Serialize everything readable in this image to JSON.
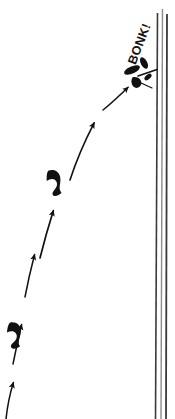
{
  "illustration": {
    "title": "Bird flying into window",
    "background_color": "#ffffff",
    "ink_color": "#111111",
    "pane_color": "#3a3a3a",
    "pane_highlight_color": "#8c8c8c",
    "canvas": {
      "width": 175,
      "height": 419
    }
  },
  "impact": {
    "label": "BONK!",
    "rotation_degrees": -69,
    "x": 140,
    "y": 44
  },
  "window_pane": {
    "name": "glass-pane",
    "line_count": 3,
    "lines": [
      {
        "x_top": 157.5,
        "y_top": 13,
        "x_bottom": 155.5,
        "y_bottom": 419,
        "width": 1.6,
        "tone": "dark"
      },
      {
        "x_top": 162.5,
        "y_top": 9,
        "x_bottom": 161.0,
        "y_bottom": 419,
        "width": 1.4,
        "tone": "soft"
      },
      {
        "x_top": 167.0,
        "y_top": 14,
        "x_bottom": 166.0,
        "y_bottom": 419,
        "width": 1.8,
        "tone": "dark"
      }
    ]
  },
  "trajectory": {
    "name": "flight-path",
    "description": "Parabolic arc from lower-left rising to upper-right impact",
    "arrows": [
      {
        "index": 0,
        "x1": 6,
        "y1": 419,
        "x2": 14,
        "y2": 381,
        "label": "motion-arrow-1"
      },
      {
        "index": 1,
        "x1": 14,
        "y1": 364,
        "x2": 22,
        "y2": 323,
        "label": "motion-arrow-2"
      },
      {
        "index": 2,
        "x1": 25,
        "y1": 297,
        "x2": 35,
        "y2": 253,
        "label": "motion-arrow-3"
      },
      {
        "index": 3,
        "x1": 40,
        "y1": 258,
        "x2": 54,
        "y2": 209,
        "label": "motion-arrow-4"
      },
      {
        "index": 4,
        "x1": 70,
        "y1": 180,
        "x2": 95,
        "y2": 121,
        "label": "motion-arrow-5"
      },
      {
        "index": 5,
        "x1": 103,
        "y1": 110,
        "x2": 129,
        "y2": 86,
        "label": "motion-arrow-6"
      }
    ],
    "birds": [
      {
        "index": 0,
        "x": 17,
        "y": 335,
        "rotation": -18,
        "scale": 1.0,
        "label": "bird-silhouette-1"
      },
      {
        "index": 1,
        "x": 57,
        "y": 182,
        "rotation": -26,
        "scale": 1.0,
        "label": "bird-silhouette-2"
      }
    ]
  },
  "impact_debris": {
    "name": "impact-burst",
    "pieces": [
      {
        "index": 0,
        "x": 132,
        "y": 70,
        "rotation": -24,
        "w": 14,
        "h": 6,
        "label": "debris-wing"
      },
      {
        "index": 1,
        "x": 143,
        "y": 64,
        "rotation": 62,
        "w": 10,
        "h": 6,
        "label": "debris-tail"
      },
      {
        "index": 2,
        "x": 138,
        "y": 81,
        "rotation": 12,
        "w": 9,
        "h": 5,
        "label": "debris-body"
      },
      {
        "index": 3,
        "x": 147,
        "y": 77,
        "rotation": -40,
        "w": 7,
        "h": 4,
        "label": "debris-fleck"
      }
    ],
    "splash_lines": [
      {
        "x1": 138,
        "y1": 76,
        "x2": 156,
        "y2": 70,
        "label": "splash-line-1"
      },
      {
        "x1": 140,
        "y1": 83,
        "x2": 152,
        "y2": 88,
        "label": "splash-line-2"
      }
    ]
  }
}
